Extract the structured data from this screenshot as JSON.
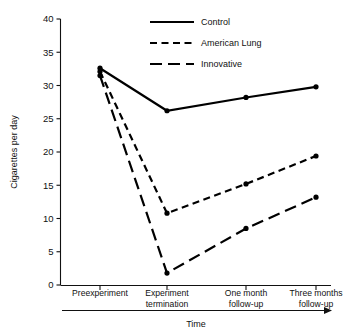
{
  "chart_data": {
    "type": "line",
    "title": "",
    "xlabel": "Time",
    "ylabel": "Cigarettes per day",
    "categories": [
      "Preexperiment",
      "Experiment termination",
      "One month follow-up",
      "Three months follow-up"
    ],
    "category_lines": [
      [
        "Preexperiment",
        ""
      ],
      [
        "Experiment",
        "termination"
      ],
      [
        "One month",
        "follow-up"
      ],
      [
        "Three months",
        "follow-up"
      ]
    ],
    "ylim": [
      0,
      40
    ],
    "yticks": [
      0,
      5,
      10,
      15,
      20,
      25,
      30,
      35,
      40
    ],
    "ytick_labels": [
      "0",
      "5",
      "10",
      "15",
      "20",
      "25",
      "30",
      "35",
      "40"
    ],
    "grid": false,
    "legend_position": "top-center",
    "series": [
      {
        "name": "Control",
        "style": "solid",
        "color": "#000000",
        "values": [
          32.6,
          26.2,
          28.2,
          29.8
        ]
      },
      {
        "name": "American Lung",
        "style": "dashed-short",
        "color": "#000000",
        "values": [
          32.1,
          10.8,
          15.2,
          19.4
        ]
      },
      {
        "name": "Innovative",
        "style": "dashed-long",
        "color": "#000000",
        "values": [
          31.5,
          1.8,
          8.5,
          13.2
        ]
      }
    ]
  },
  "legend": {
    "items": [
      {
        "label": "Control"
      },
      {
        "label": "American Lung"
      },
      {
        "label": "Innovative"
      }
    ]
  },
  "axes": {
    "y_title": "Cigarettes per day",
    "x_title": "Time"
  }
}
